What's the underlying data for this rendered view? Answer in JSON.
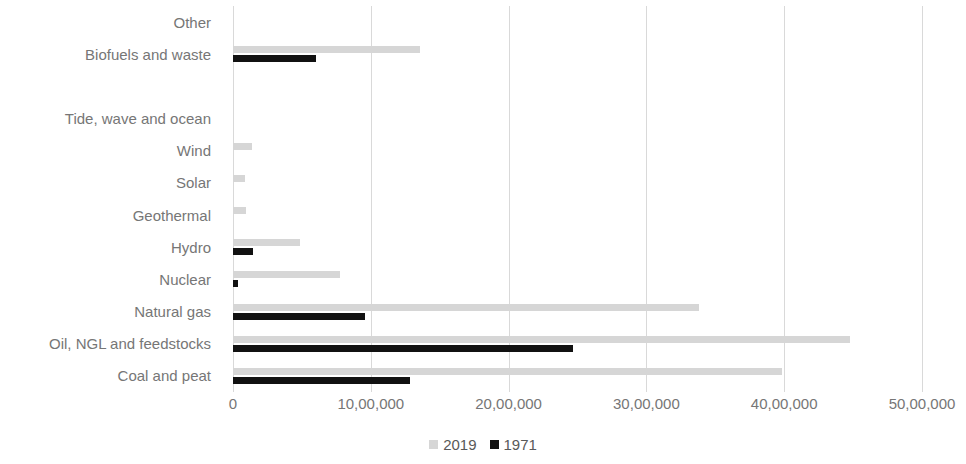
{
  "chart_data": {
    "type": "bar",
    "orientation": "horizontal",
    "title": "",
    "xlabel": "",
    "ylabel": "",
    "xlim": [
      0,
      5000000
    ],
    "xticks": [
      0,
      1000000,
      2000000,
      3000000,
      4000000,
      5000000
    ],
    "xtick_labels": [
      "0",
      "10,00,000",
      "20,00,000",
      "30,00,000",
      "40,00,000",
      "50,00,000"
    ],
    "grid": true,
    "grid_axis": "x",
    "legend_position": "bottom",
    "categories": [
      "Other",
      "Biofuels and waste",
      "",
      "Tide, wave and ocean",
      "Wind",
      "Solar",
      "Geothermal",
      "Hydro",
      "Nuclear",
      "Natural gas",
      "Oil, NGL and feedstocks",
      "Coal and peat"
    ],
    "series": [
      {
        "name": "2019",
        "color": "#d6d6d6",
        "values": [
          0,
          1355000,
          0,
          0,
          140000,
          85000,
          95000,
          485000,
          775000,
          3385000,
          4475000,
          3985000
        ]
      },
      {
        "name": "1971",
        "color": "#111111",
        "values": [
          0,
          600000,
          0,
          0,
          0,
          0,
          0,
          145000,
          35000,
          955000,
          2465000,
          1285000
        ]
      }
    ]
  },
  "legend": {
    "items": [
      {
        "label": "2019",
        "color": "#d6d6d6"
      },
      {
        "label": "1971",
        "color": "#111111"
      }
    ]
  }
}
